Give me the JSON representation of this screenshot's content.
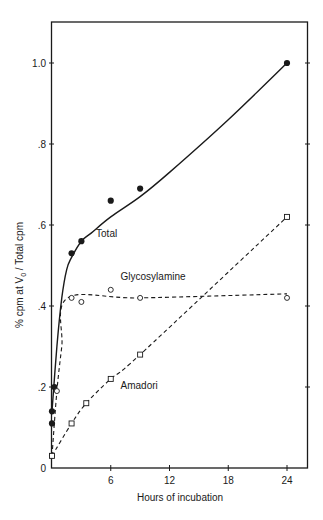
{
  "chart_data": {
    "type": "line",
    "title": "",
    "xlabel": "Hours of incubation",
    "ylabel": "% cpm at V0 / Total cpm",
    "ylabel_parts": {
      "pre": "% cpm at V",
      "sub": "0",
      "post": " / Total cpm"
    },
    "xlim": [
      0,
      26
    ],
    "ylim": [
      0,
      1.1
    ],
    "xticks": [
      0,
      6,
      12,
      18,
      24
    ],
    "xtick_labels": [
      "",
      "6",
      "12",
      "18",
      "24"
    ],
    "yticks": [
      0,
      0.2,
      0.4,
      0.6,
      0.8,
      1.0
    ],
    "ytick_labels": [
      "0",
      ".2",
      ".4",
      ".6",
      ".8",
      "1.0"
    ],
    "origin_label": "0",
    "grid": false,
    "legend": "inline labels",
    "series": [
      {
        "name": "Total",
        "marker": "filled-circle",
        "line": "solid",
        "points": [
          [
            0,
            0.11
          ],
          [
            0,
            0.14
          ],
          [
            0.25,
            0.2
          ],
          [
            2,
            0.53
          ],
          [
            3,
            0.56
          ],
          [
            6,
            0.66
          ],
          [
            9,
            0.69
          ],
          [
            24,
            1.0
          ]
        ],
        "curve": [
          [
            0,
            0.14
          ],
          [
            0.5,
            0.3
          ],
          [
            1,
            0.42
          ],
          [
            1.5,
            0.49
          ],
          [
            2,
            0.52
          ],
          [
            3,
            0.56
          ],
          [
            4,
            0.58
          ],
          [
            6,
            0.62
          ],
          [
            9,
            0.67
          ],
          [
            12,
            0.73
          ],
          [
            18,
            0.86
          ],
          [
            24,
            1.0
          ]
        ],
        "label_pos": [
          4.5,
          0.57
        ]
      },
      {
        "name": "Glycosylamine",
        "marker": "open-circle",
        "line": "dashed",
        "points": [
          [
            0,
            0.03
          ],
          [
            0.5,
            0.19
          ],
          [
            2,
            0.42
          ],
          [
            3,
            0.41
          ],
          [
            6,
            0.44
          ],
          [
            9,
            0.42
          ],
          [
            24,
            0.42
          ]
        ],
        "curve": [
          [
            0,
            0.03
          ],
          [
            0.5,
            0.19
          ],
          [
            1,
            0.3
          ],
          [
            1.6,
            0.42
          ],
          [
            9,
            0.42
          ],
          [
            24,
            0.43
          ]
        ],
        "label_pos": [
          7,
          0.465
        ]
      },
      {
        "name": "Amadori",
        "marker": "open-square",
        "line": "dashed",
        "points": [
          [
            0,
            0.03
          ],
          [
            2,
            0.11
          ],
          [
            3.5,
            0.16
          ],
          [
            6,
            0.22
          ],
          [
            9,
            0.28
          ],
          [
            24,
            0.62
          ]
        ],
        "curve": [
          [
            0,
            0.03
          ],
          [
            2,
            0.11
          ],
          [
            3.5,
            0.16
          ],
          [
            6,
            0.22
          ],
          [
            9,
            0.28
          ],
          [
            24,
            0.62
          ]
        ],
        "label_pos": [
          7,
          0.195
        ]
      }
    ]
  },
  "colors": {
    "ink": "#1a1a1a",
    "background": "#ffffff"
  }
}
